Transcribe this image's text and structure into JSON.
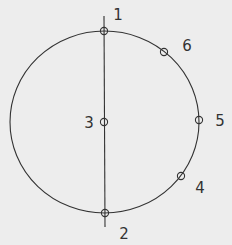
{
  "diagram": {
    "background": "#ededed",
    "stroke_color": "#333333",
    "circle": {
      "cx": 104.5,
      "cy": 122,
      "rx": 94.5,
      "ry": 91
    },
    "axis_line": {
      "x1": 104,
      "y1": 16,
      "x2": 105,
      "y2": 227
    },
    "points": [
      {
        "id": "1",
        "label": "1",
        "x": 104,
        "y": 31,
        "lx": 118,
        "ly": 20
      },
      {
        "id": "2",
        "label": "2",
        "x": 105,
        "y": 213,
        "lx": 124,
        "ly": 239
      },
      {
        "id": "3",
        "label": "3",
        "x": 104,
        "y": 122,
        "lx": 89,
        "ly": 128
      },
      {
        "id": "4",
        "label": "4",
        "x": 181,
        "y": 176,
        "lx": 200,
        "ly": 193
      },
      {
        "id": "5",
        "label": "5",
        "x": 199,
        "y": 120,
        "lx": 220,
        "ly": 126
      },
      {
        "id": "6",
        "label": "6",
        "x": 164,
        "y": 52,
        "lx": 187,
        "ly": 51
      }
    ]
  }
}
